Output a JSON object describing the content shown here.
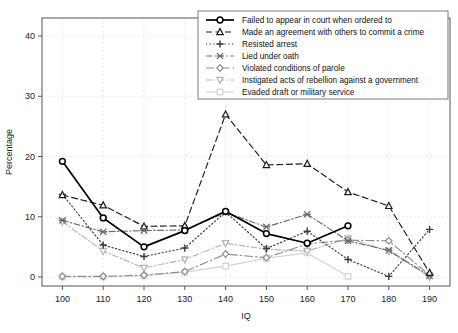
{
  "chart_data": {
    "type": "line",
    "title": "",
    "xlabel": "IQ",
    "ylabel": "Percentage",
    "x": [
      100,
      110,
      120,
      130,
      140,
      150,
      160,
      170,
      180,
      190
    ],
    "categories": [
      "100",
      "110",
      "120",
      "130",
      "140",
      "150",
      "160",
      "170",
      "180",
      "190"
    ],
    "xlim": [
      95,
      195
    ],
    "ylim": [
      -1.5,
      43
    ],
    "xticks": [
      100,
      110,
      120,
      130,
      140,
      150,
      160,
      170,
      180,
      190
    ],
    "yticks": [
      0,
      10,
      20,
      30,
      40
    ],
    "grid": true,
    "legend_position": "top-right",
    "series": [
      {
        "name": "Failed to appear in court when ordered to",
        "marker": "circle-filled",
        "dash": "solid",
        "color": "#000000",
        "values": [
          19.2,
          9.8,
          5.0,
          7.7,
          10.9,
          7.2,
          5.6,
          8.5,
          null,
          null
        ]
      },
      {
        "name": "Made an agreement with others to commit a crime",
        "marker": "triangle-up",
        "dash": "dashed",
        "color": "#1c1c1c",
        "values": [
          13.6,
          11.9,
          8.4,
          8.5,
          27.0,
          18.6,
          18.8,
          14.1,
          11.8,
          0.7
        ]
      },
      {
        "name": "Resisted arrest",
        "marker": "plus",
        "dash": "dotted",
        "color": "#3a3a3a",
        "values": [
          13.7,
          5.3,
          3.4,
          4.8,
          10.8,
          4.7,
          7.6,
          2.9,
          0.1,
          7.9
        ]
      },
      {
        "name": "Lied under oath",
        "marker": "x-cross",
        "dash": "dashdot",
        "color": "#6b6b6b",
        "values": [
          9.4,
          7.5,
          7.7,
          7.8,
          10.7,
          8.3,
          10.4,
          6.0,
          4.4,
          0.2
        ]
      },
      {
        "name": "Violated conditions of parole",
        "marker": "diamond",
        "dash": "dashdot-long",
        "color": "#8d8d8d",
        "values": [
          0.1,
          0.1,
          0.3,
          0.9,
          3.8,
          3.2,
          5.5,
          6.1,
          6.0,
          0.3
        ]
      },
      {
        "name": "Instigated acts of rebellion against a government",
        "marker": "triangle-down",
        "dash": "dashdot",
        "color": "#b4b4b4",
        "values": [
          9.2,
          4.3,
          1.5,
          2.9,
          5.6,
          4.6,
          4.3,
          6.4,
          4.3,
          0.0
        ]
      },
      {
        "name": "Evaded draft or military service",
        "marker": "square",
        "dash": "solid-light",
        "color": "#d2d2d2",
        "values": [
          0.0,
          0.0,
          0.2,
          0.8,
          1.8,
          3.1,
          4.0,
          0.1,
          null,
          null
        ]
      }
    ]
  },
  "axes": {
    "ylabel": "Percentage",
    "xlabel": "IQ",
    "ytick_labels": [
      "0",
      "10",
      "20",
      "30",
      "40"
    ],
    "xtick_labels": [
      "100",
      "110",
      "120",
      "130",
      "140",
      "150",
      "160",
      "170",
      "180",
      "190"
    ]
  },
  "legend": {
    "items": [
      {
        "label": "Failed to appear in court when ordered to"
      },
      {
        "label": "Made an agreement with others to commit a crime"
      },
      {
        "label": "Resisted arrest"
      },
      {
        "label": "Lied under oath"
      },
      {
        "label": "Violated conditions of parole"
      },
      {
        "label": "Instigated acts of rebellion against a government"
      },
      {
        "label": "Evaded draft or military service"
      }
    ]
  }
}
